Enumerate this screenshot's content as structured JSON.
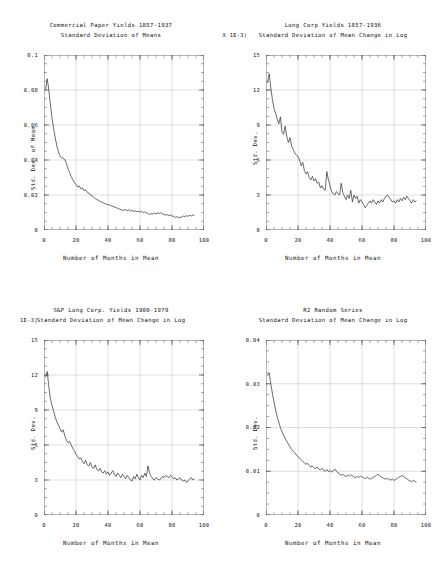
{
  "figure": {
    "background": "#ffffff",
    "line_color": "#333333",
    "grid_color": "#b9b9b9",
    "axis_color": "#555555",
    "panel_count": 4,
    "layout": "2x2"
  },
  "chart_data": [
    {
      "id": "commercial-paper",
      "type": "line",
      "title": "Commercial Paper Yields 1857-1937",
      "subtitle": "Standard Deviation of Means",
      "xlabel": "Number of Months in Mean",
      "ylabel": "Std. Dev. of Mean",
      "scale_note": "",
      "xlim": [
        0,
        100
      ],
      "ylim": [
        0,
        0.1
      ],
      "xticks": [
        0,
        20,
        40,
        60,
        80,
        100
      ],
      "yticks": [
        0,
        0.02,
        0.04,
        0.06,
        0.08,
        0.1
      ],
      "xticklabels": [
        "0",
        "20",
        "40",
        "60",
        "80",
        "100"
      ],
      "yticklabels": [
        "0",
        "0.02",
        "0.04",
        "0.06",
        "0.08",
        "0.1"
      ],
      "grid": true,
      "legend": "none",
      "x": [
        1,
        2,
        3,
        4,
        5,
        6,
        7,
        8,
        9,
        10,
        11,
        12,
        13,
        14,
        15,
        16,
        17,
        18,
        19,
        20,
        21,
        22,
        23,
        24,
        25,
        26,
        27,
        28,
        29,
        30,
        31,
        32,
        33,
        34,
        35,
        36,
        37,
        38,
        39,
        40,
        41,
        42,
        43,
        44,
        45,
        46,
        47,
        48,
        49,
        50,
        51,
        52,
        53,
        54,
        55,
        56,
        57,
        58,
        59,
        60,
        61,
        62,
        63,
        64,
        65,
        66,
        67,
        68,
        69,
        70,
        71,
        72,
        73,
        74,
        75,
        76,
        77,
        78,
        79,
        80,
        81,
        82,
        83,
        84,
        85,
        86,
        87,
        88,
        89,
        90,
        91,
        92,
        93,
        94
      ],
      "y": [
        0.0805,
        0.0865,
        0.08,
        0.0715,
        0.064,
        0.058,
        0.0528,
        0.0482,
        0.0448,
        0.0423,
        0.0412,
        0.0408,
        0.0403,
        0.038,
        0.0352,
        0.0328,
        0.0305,
        0.0288,
        0.027,
        0.0262,
        0.0246,
        0.0252,
        0.0236,
        0.024,
        0.0225,
        0.023,
        0.0216,
        0.0212,
        0.02,
        0.0196,
        0.0188,
        0.018,
        0.0174,
        0.017,
        0.0163,
        0.016,
        0.0156,
        0.015,
        0.0148,
        0.0143,
        0.0144,
        0.0138,
        0.0136,
        0.0132,
        0.0128,
        0.0124,
        0.012,
        0.0116,
        0.0114,
        0.0112,
        0.0118,
        0.011,
        0.0116,
        0.0108,
        0.0112,
        0.0106,
        0.011,
        0.0104,
        0.0108,
        0.0102,
        0.0106,
        0.01,
        0.0104,
        0.0098,
        0.0096,
        0.0088,
        0.0094,
        0.009,
        0.0097,
        0.0092,
        0.0098,
        0.0094,
        0.0099,
        0.0092,
        0.009,
        0.0084,
        0.0088,
        0.0082,
        0.0086,
        0.008,
        0.0078,
        0.0072,
        0.0076,
        0.007,
        0.0074,
        0.0072,
        0.008,
        0.0076,
        0.0082,
        0.0078,
        0.0084,
        0.008,
        0.0086,
        0.0082
      ]
    },
    {
      "id": "long-corp",
      "type": "line",
      "title": "Long Corp Yields 1857-1936",
      "subtitle": "Standard Deviation of Mean Change in Log",
      "xlabel": "Number of Months in Mean",
      "ylabel": "Std. Dev.",
      "scale_note": "(X 1E-3)",
      "xlim": [
        0,
        100
      ],
      "ylim": [
        0,
        15
      ],
      "xticks": [
        0,
        20,
        40,
        60,
        80,
        100
      ],
      "yticks": [
        0,
        3,
        6,
        9,
        12,
        15
      ],
      "xticklabels": [
        "0",
        "20",
        "40",
        "60",
        "80",
        "100"
      ],
      "yticklabels": [
        "0",
        "3",
        "6",
        "9",
        "12",
        "15"
      ],
      "grid": true,
      "legend": "none",
      "x": [
        1,
        2,
        3,
        4,
        5,
        6,
        7,
        8,
        9,
        10,
        11,
        12,
        13,
        14,
        15,
        16,
        17,
        18,
        19,
        20,
        21,
        22,
        23,
        24,
        25,
        26,
        27,
        28,
        29,
        30,
        31,
        32,
        33,
        34,
        35,
        36,
        37,
        38,
        39,
        40,
        41,
        42,
        43,
        44,
        45,
        46,
        47,
        48,
        49,
        50,
        51,
        52,
        53,
        54,
        55,
        56,
        57,
        58,
        59,
        60,
        61,
        62,
        63,
        64,
        65,
        66,
        67,
        68,
        69,
        70,
        71,
        72,
        73,
        74,
        75,
        76,
        77,
        78,
        79,
        80,
        81,
        82,
        83,
        84,
        85,
        86,
        87,
        88,
        89,
        90,
        91,
        92,
        93,
        94
      ],
      "y": [
        12.6,
        13.4,
        12.2,
        11.2,
        10.4,
        10.0,
        9.5,
        9.1,
        9.7,
        8.4,
        8.2,
        8.9,
        8.0,
        7.5,
        7.9,
        7.2,
        6.9,
        6.6,
        6.4,
        6.3,
        6.0,
        5.5,
        5.8,
        5.1,
        4.8,
        5.0,
        4.5,
        4.3,
        4.6,
        4.2,
        4.4,
        4.0,
        4.1,
        3.6,
        3.8,
        3.5,
        3.4,
        5.0,
        4.3,
        3.8,
        3.3,
        3.1,
        3.0,
        3.3,
        3.1,
        3.0,
        4.0,
        3.2,
        2.9,
        2.6,
        3.0,
        2.7,
        3.4,
        2.4,
        3.0,
        2.7,
        2.9,
        2.3,
        2.6,
        2.4,
        2.2,
        1.9,
        2.1,
        2.3,
        2.5,
        2.3,
        2.6,
        2.4,
        2.2,
        2.5,
        2.3,
        2.6,
        2.4,
        2.7,
        2.9,
        3.0,
        2.8,
        2.6,
        2.4,
        2.5,
        2.3,
        2.6,
        2.4,
        2.7,
        2.5,
        2.8,
        2.6,
        2.9,
        2.7,
        2.5,
        2.3,
        2.6,
        2.4,
        2.5
      ]
    },
    {
      "id": "sp-long-corp",
      "type": "line",
      "title": "S&P Long Corp. Yields 1900-1979",
      "subtitle": "Standard Deviation of Mean Change in Log",
      "xlabel": "Number of Months in Mean",
      "ylabel": "Std. Dev.",
      "scale_note": "1E-3)",
      "xlim": [
        0,
        100
      ],
      "ylim": [
        0,
        15
      ],
      "xticks": [
        0,
        20,
        40,
        60,
        80,
        100
      ],
      "yticks": [
        0,
        3,
        6,
        9,
        12,
        15
      ],
      "xticklabels": [
        "0",
        "20",
        "40",
        "60",
        "80",
        "100"
      ],
      "yticklabels": [
        "0",
        "3",
        "6",
        "9",
        "12",
        "15"
      ],
      "grid": true,
      "legend": "none",
      "x": [
        1,
        2,
        3,
        4,
        5,
        6,
        7,
        8,
        9,
        10,
        11,
        12,
        13,
        14,
        15,
        16,
        17,
        18,
        19,
        20,
        21,
        22,
        23,
        24,
        25,
        26,
        27,
        28,
        29,
        30,
        31,
        32,
        33,
        34,
        35,
        36,
        37,
        38,
        39,
        40,
        41,
        42,
        43,
        44,
        45,
        46,
        47,
        48,
        49,
        50,
        51,
        52,
        53,
        54,
        55,
        56,
        57,
        58,
        59,
        60,
        61,
        62,
        63,
        64,
        65,
        66,
        67,
        68,
        69,
        70,
        71,
        72,
        73,
        74,
        75,
        76,
        77,
        78,
        79,
        80,
        81,
        82,
        83,
        84,
        85,
        86,
        87,
        88,
        89,
        90,
        91,
        92,
        93,
        94
      ],
      "y": [
        11.8,
        12.3,
        11.0,
        10.0,
        9.4,
        8.9,
        8.4,
        8.0,
        7.7,
        7.4,
        7.1,
        7.3,
        6.8,
        6.4,
        6.2,
        6.3,
        6.0,
        5.7,
        5.5,
        5.2,
        5.0,
        4.8,
        4.9,
        4.6,
        4.4,
        4.7,
        4.3,
        4.2,
        4.5,
        4.1,
        4.0,
        4.3,
        3.9,
        3.8,
        4.0,
        3.7,
        3.6,
        3.8,
        3.5,
        3.7,
        3.4,
        3.6,
        3.8,
        3.5,
        3.3,
        3.6,
        3.4,
        3.2,
        3.5,
        3.3,
        3.1,
        3.4,
        3.2,
        3.0,
        2.9,
        3.3,
        3.1,
        3.5,
        3.2,
        3.0,
        3.4,
        3.2,
        3.6,
        3.3,
        4.2,
        3.6,
        3.3,
        3.1,
        3.0,
        3.2,
        3.1,
        3.0,
        3.1,
        3.3,
        3.2,
        3.4,
        3.3,
        3.2,
        3.4,
        3.3,
        3.1,
        3.2,
        3.0,
        3.1,
        3.2,
        3.0,
        2.9,
        3.0,
        2.8,
        2.9,
        3.1,
        3.2,
        3.0,
        3.1
      ]
    },
    {
      "id": "r2-random",
      "type": "line",
      "title": "R2 Random Series",
      "subtitle": "Standard Deviation of Mean Change in Log",
      "xlabel": "Number of Months in Mean",
      "ylabel": "Std. Dev.",
      "scale_note": "",
      "xlim": [
        0,
        100
      ],
      "ylim": [
        0,
        0.04
      ],
      "xticks": [
        0,
        20,
        40,
        60,
        80,
        100
      ],
      "yticks": [
        0,
        0.01,
        0.02,
        0.03,
        0.04
      ],
      "xticklabels": [
        "0",
        "20",
        "40",
        "60",
        "80",
        "100"
      ],
      "yticklabels": [
        "0",
        "0.01",
        "0.02",
        "0.03",
        "0.04"
      ],
      "grid": true,
      "legend": "none",
      "x": [
        1,
        2,
        3,
        4,
        5,
        6,
        7,
        8,
        9,
        10,
        11,
        12,
        13,
        14,
        15,
        16,
        17,
        18,
        19,
        20,
        21,
        22,
        23,
        24,
        25,
        26,
        27,
        28,
        29,
        30,
        31,
        32,
        33,
        34,
        35,
        36,
        37,
        38,
        39,
        40,
        41,
        42,
        43,
        44,
        45,
        46,
        47,
        48,
        49,
        50,
        51,
        52,
        53,
        54,
        55,
        56,
        57,
        58,
        59,
        60,
        61,
        62,
        63,
        64,
        65,
        66,
        67,
        68,
        69,
        70,
        71,
        72,
        73,
        74,
        75,
        76,
        77,
        78,
        79,
        80,
        81,
        82,
        83,
        84,
        85,
        86,
        87,
        88,
        89,
        90,
        91,
        92,
        93,
        94
      ],
      "y": [
        0.0318,
        0.0325,
        0.03,
        0.0278,
        0.0258,
        0.024,
        0.0225,
        0.0212,
        0.02,
        0.019,
        0.0182,
        0.0175,
        0.0168,
        0.0162,
        0.0156,
        0.015,
        0.0146,
        0.0142,
        0.0137,
        0.0133,
        0.013,
        0.0126,
        0.0122,
        0.0119,
        0.0116,
        0.0118,
        0.0113,
        0.011,
        0.0112,
        0.0108,
        0.0106,
        0.011,
        0.0105,
        0.0103,
        0.0107,
        0.0102,
        0.01,
        0.0104,
        0.0099,
        0.0102,
        0.0098,
        0.0101,
        0.0105,
        0.01,
        0.0096,
        0.0094,
        0.0091,
        0.0093,
        0.009,
        0.0088,
        0.0091,
        0.0089,
        0.0092,
        0.009,
        0.0087,
        0.0085,
        0.0088,
        0.0086,
        0.0089,
        0.0087,
        0.0085,
        0.0083,
        0.0086,
        0.0084,
        0.0082,
        0.0084,
        0.0086,
        0.0088,
        0.0091,
        0.0093,
        0.009,
        0.0087,
        0.0085,
        0.0083,
        0.0082,
        0.0084,
        0.0081,
        0.008,
        0.0082,
        0.0079,
        0.0081,
        0.0083,
        0.0086,
        0.0088,
        0.009,
        0.0088,
        0.0085,
        0.0083,
        0.008,
        0.0078,
        0.0076,
        0.0079,
        0.0077,
        0.0075
      ]
    }
  ]
}
